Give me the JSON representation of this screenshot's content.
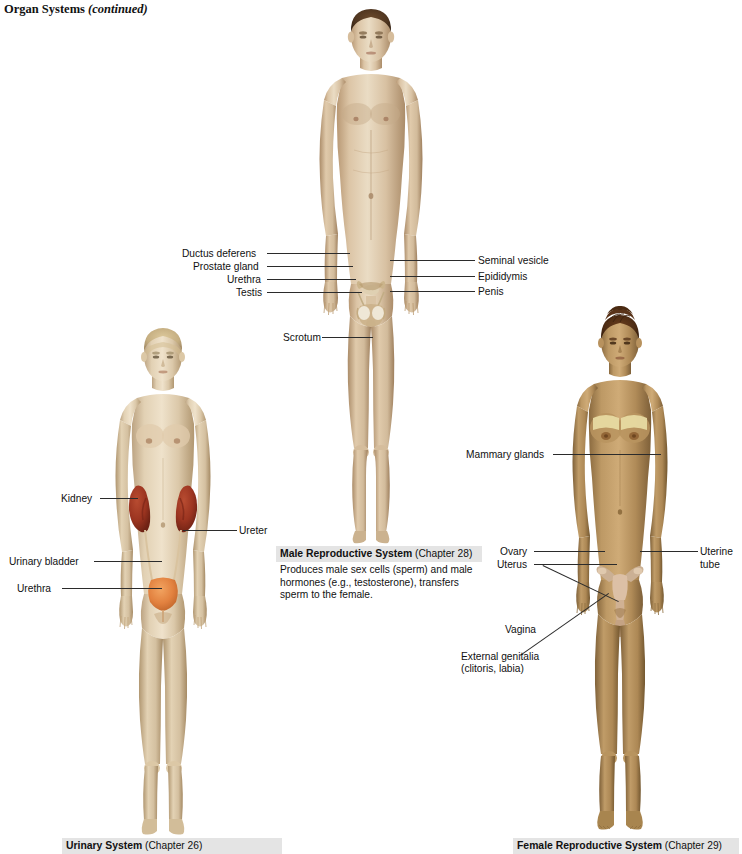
{
  "page": {
    "header_title": "Organ Systems",
    "header_continued": "(continued)"
  },
  "male_figure": {
    "name": "male-body-figure",
    "skin_light": "#e3cdb0",
    "skin_mid": "#cbb091",
    "skin_shadow": "#ab8f71",
    "hair": "#5a4028",
    "organ_pale": "#ded0b6",
    "organ_tan": "#c9b289",
    "labels_left": [
      {
        "text": "Ductus deferens",
        "x": 182,
        "y": 249
      },
      {
        "text": "Prostate gland",
        "x": 193,
        "y": 262
      },
      {
        "text": "Urethra",
        "x": 227,
        "y": 275
      },
      {
        "text": "Testis",
        "x": 236,
        "y": 288
      },
      {
        "text": "Scrotum",
        "x": 283,
        "y": 333
      }
    ],
    "labels_right": [
      {
        "text": "Seminal vesicle",
        "x": 477,
        "y": 256
      },
      {
        "text": "Epididymis",
        "x": 477,
        "y": 272
      },
      {
        "text": "Penis",
        "x": 477,
        "y": 287
      }
    ]
  },
  "male_caption": {
    "title": "Male Reproductive System",
    "chapter": "(Chapter 28)",
    "body": "Produces male sex cells (sperm) and male hormones (e.g., testosterone), transfers sperm to the female."
  },
  "urinary_figure": {
    "name": "female-urinary-figure",
    "skin_light": "#e4d3b9",
    "skin_mid": "#cdb998",
    "skin_shadow": "#ad9877",
    "hair": "#cdb98d",
    "kidney_color": "#9b3420",
    "bladder_color": "#e2813f",
    "ureter_color": "#d9c39f",
    "labels": [
      {
        "text": "Kidney",
        "x": 61,
        "y": 494,
        "align": "left"
      },
      {
        "text": "Ureter",
        "x": 239,
        "y": 526,
        "align": "left"
      },
      {
        "text": "Urinary bladder",
        "x": 9,
        "y": 557,
        "align": "left"
      },
      {
        "text": "Urethra",
        "x": 17,
        "y": 584,
        "align": "left"
      }
    ]
  },
  "urinary_caption": {
    "title": "Urinary System",
    "chapter": "(Chapter 26)",
    "clipped": true
  },
  "female_figure": {
    "name": "female-reproductive-figure",
    "skin_light": "#c9a271",
    "skin_mid": "#ab8453",
    "skin_shadow": "#8a6a3f",
    "hair": "#4a2c16",
    "gland_color": "#e8dca4",
    "uterus_color": "#d9bda4",
    "labels": [
      {
        "text": "Mammary glands",
        "x": 466,
        "y": 450
      },
      {
        "text": "Ovary",
        "x": 500,
        "y": 547
      },
      {
        "text": "Uterus",
        "x": 497,
        "y": 560
      },
      {
        "text": "Uterine",
        "x": 700,
        "y": 547
      },
      {
        "text": "tube",
        "x": 700,
        "y": 560
      },
      {
        "text": "Vagina",
        "x": 505,
        "y": 625
      },
      {
        "text": "External genitalia",
        "x": 461,
        "y": 652
      },
      {
        "text": "(clitoris, labia)",
        "x": 461,
        "y": 664
      }
    ]
  },
  "female_caption": {
    "title": "Female Reproductive System",
    "chapter": "(Chapter 29)",
    "clipped": true
  }
}
